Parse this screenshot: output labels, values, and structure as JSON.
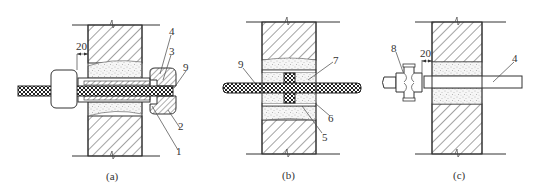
{
  "colors": {
    "line": "#333333",
    "background": "#ffffff",
    "sand": "#f4f4f4"
  },
  "figures": [
    {
      "id": "a",
      "caption": "(a)",
      "dimension": "20",
      "labels": [
        "4",
        "3",
        "9",
        "2",
        "1"
      ]
    },
    {
      "id": "b",
      "caption": "(b)",
      "labels": [
        "9",
        "7",
        "6",
        "5"
      ]
    },
    {
      "id": "c",
      "caption": "(c)",
      "dimension": "20",
      "labels": [
        "8",
        "4"
      ]
    }
  ]
}
